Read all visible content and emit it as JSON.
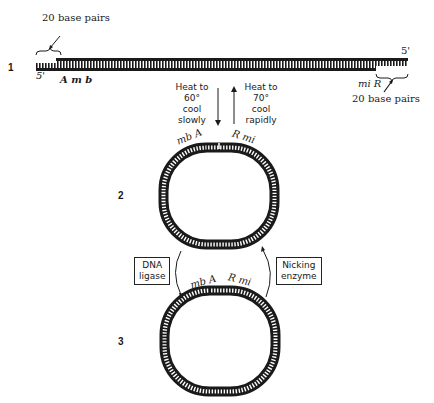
{
  "diagram": {
    "steps": [
      {
        "number": "1",
        "description": "linear double-stranded DNA with 20-base single-stranded cohesive ends"
      },
      {
        "number": "2",
        "description": "circularized via base-paired cohesive ends (nicked)"
      },
      {
        "number": "3",
        "description": "covalently closed circle"
      }
    ],
    "linear": {
      "left_brace_label": "20 base pairs",
      "right_brace_label": "20 base pairs",
      "left_end_label": "5'",
      "right_end_label": "5'",
      "left_seq_label": "A m b",
      "right_seq_label": "mi R"
    },
    "transitions": {
      "down_label": "Heat to\n60°\ncool\nslowly",
      "up_label": "Heat to\n70°\ncool\nrapidly",
      "left_enzyme": "DNA\nligase",
      "right_enzyme": "Nicking\nenzyme"
    },
    "circle2": {
      "left_label": "mb A",
      "right_label": "R mi"
    },
    "circle3": {
      "left_label": "mb A",
      "right_label": "R mi"
    }
  }
}
